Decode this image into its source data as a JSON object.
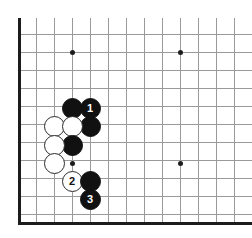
{
  "figure": {
    "name": "go-board-diagram",
    "board_type": "go",
    "width": 252,
    "height": 238,
    "background_color": "#ffffff",
    "grid": {
      "spacing": 18,
      "line_color": "#9a9a9a",
      "edge_color": "#1c1c1c",
      "origin_x": 18,
      "origin_y": 34,
      "vertical_lines_x": [
        18,
        36,
        54,
        72,
        90,
        108,
        126,
        144,
        162,
        180,
        198,
        216,
        234,
        252
      ],
      "horizontal_lines_y": [
        34,
        52,
        70,
        88,
        106,
        124,
        142,
        160,
        178,
        196,
        214,
        222
      ],
      "vertical_line_top": 18,
      "vertical_line_bottom": 222,
      "left_edge_x": 18,
      "bottom_edge_y": 222
    },
    "star_points": [
      {
        "name": "star-point-top-left",
        "x": 72,
        "y": 52
      },
      {
        "name": "star-point-top-right",
        "x": 180,
        "y": 52
      },
      {
        "name": "star-point-bottom-left",
        "x": 72,
        "y": 163
      },
      {
        "name": "star-point-bottom-right",
        "x": 180,
        "y": 163
      }
    ],
    "stones": [
      {
        "name": "stone-black-a",
        "color": "black",
        "x": 72,
        "y": 108,
        "label": ""
      },
      {
        "name": "stone-black-move-1",
        "color": "black",
        "x": 90,
        "y": 108,
        "label": "1"
      },
      {
        "name": "stone-black-b",
        "color": "black",
        "x": 90,
        "y": 126,
        "label": ""
      },
      {
        "name": "stone-white-a",
        "color": "white",
        "x": 54,
        "y": 126,
        "label": ""
      },
      {
        "name": "stone-white-b",
        "color": "white",
        "x": 72,
        "y": 126,
        "label": ""
      },
      {
        "name": "stone-black-c",
        "color": "black",
        "x": 72,
        "y": 145,
        "label": ""
      },
      {
        "name": "stone-white-c",
        "color": "white",
        "x": 54,
        "y": 145,
        "label": ""
      },
      {
        "name": "stone-white-d",
        "color": "white",
        "x": 54,
        "y": 163,
        "label": ""
      },
      {
        "name": "stone-white-move-2",
        "color": "white",
        "x": 72,
        "y": 181,
        "label": "2"
      },
      {
        "name": "stone-black-d",
        "color": "black",
        "x": 90,
        "y": 181,
        "label": ""
      },
      {
        "name": "stone-black-move-3",
        "color": "black",
        "x": 90,
        "y": 199,
        "label": "3"
      }
    ],
    "colors": {
      "black_stone": "#111111",
      "white_stone": "#ffffff",
      "white_stone_border": "#2a2a2a",
      "black_label": "#ffffff",
      "white_label": "#111111"
    }
  }
}
